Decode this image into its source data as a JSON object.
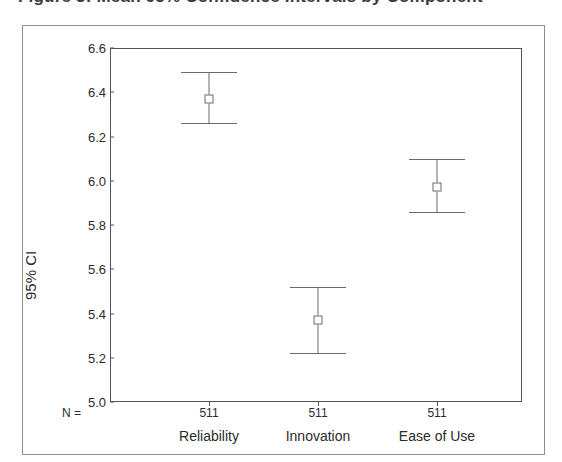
{
  "figure": {
    "cut_off_title": "Figure 3: Mean 95% Confidence Intervals by Component",
    "y_axis_title": "95% CI",
    "n_row_label": "N ="
  },
  "chart_data": {
    "type": "scatter",
    "title": "",
    "xlabel": "",
    "ylabel": "95% CI",
    "ylim": [
      5.0,
      6.6
    ],
    "ytick_step": 0.2,
    "grid": false,
    "legend": "none",
    "categories": [
      "Reliability",
      "Innovation",
      "Ease of Use"
    ],
    "counts": [
      511,
      511,
      511
    ],
    "count_labels": [
      "511",
      "511",
      "511"
    ],
    "ytick_labels": [
      "6.6",
      "6.4",
      "6.2",
      "6.0",
      "5.8",
      "5.6",
      "5.4",
      "5.2",
      "5.0"
    ],
    "ytick_values": [
      6.6,
      6.4,
      6.2,
      6.0,
      5.8,
      5.6,
      5.4,
      5.2,
      5.0
    ],
    "series": [
      {
        "name": "Mean with 95% CI",
        "means": [
          6.37,
          5.37,
          5.97
        ],
        "ci_lower": [
          6.26,
          5.22,
          5.86
        ],
        "ci_upper": [
          6.49,
          5.52,
          6.1
        ]
      }
    ],
    "colors": {
      "marker": "#6a6a6a",
      "line": "#6a6a6a",
      "axis": "#555555",
      "border": "#8d8d8d",
      "background": "#ffffff"
    }
  }
}
